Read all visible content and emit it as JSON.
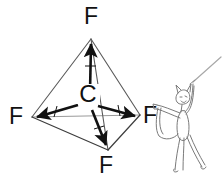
{
  "diagram": {
    "type": "molecular-geometry",
    "central_atom": {
      "label": "C",
      "x": 88,
      "y": 101
    },
    "vertices": [
      {
        "id": "top",
        "label": "F",
        "x": 91,
        "y": 38,
        "label_x": 91,
        "label_y": 24
      },
      {
        "id": "left",
        "label": "F",
        "x": 32,
        "y": 117,
        "label_x": 16,
        "label_y": 124
      },
      {
        "id": "right",
        "label": "F",
        "x": 140,
        "y": 115,
        "label_x": 150,
        "label_y": 123
      },
      {
        "id": "bottom-front",
        "label": "F",
        "x": 108,
        "y": 151,
        "label_x": 106,
        "label_y": 173
      }
    ],
    "dipole_arrows": [
      {
        "id": "dipole-up",
        "from_x": 90,
        "to_x": 91,
        "from_y": 92,
        "to_y": 42
      },
      {
        "id": "dipole-left",
        "from_x": 78,
        "to_x": 35,
        "from_y": 105,
        "to_y": 117
      },
      {
        "id": "dipole-right",
        "from_x": 97,
        "to_x": 137,
        "from_y": 106,
        "to_y": 116
      },
      {
        "id": "dipole-down",
        "from_x": 92,
        "to_x": 107,
        "from_y": 110,
        "to_y": 148
      }
    ],
    "colors": {
      "ink": "#111111",
      "edge": "#4a4a4a",
      "back_edge": "#8c8c8c",
      "figure": "#6e6e6e",
      "background": "#ffffff"
    },
    "cartoon": {
      "name": "devil-figure",
      "description": "cartoon devil holding a whip",
      "whip_tip_x": 219,
      "whip_tip_y": 60
    }
  }
}
